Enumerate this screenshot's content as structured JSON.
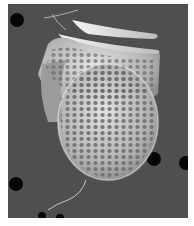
{
  "image": {
    "kind": "scanning-electron-micrograph",
    "subject": "pitted armored cell (dinoflagellate-like theca) on porous filter",
    "grayscale": true,
    "colors": {
      "background": "#505050",
      "cell_light": "#d8d8d8",
      "cell_mid": "#a8a8a8",
      "pits": "#5a5a5a",
      "filter_holes": "#080808",
      "border": "#ffffff"
    }
  }
}
